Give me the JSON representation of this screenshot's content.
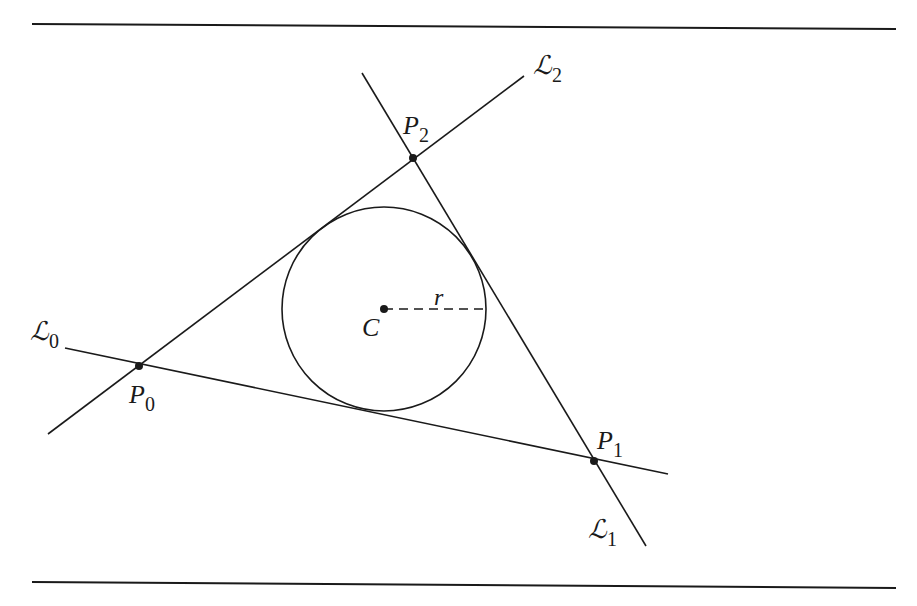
{
  "diagram": {
    "colors": {
      "stroke": "#1a1a1a",
      "background": "#ffffff"
    },
    "rules": {
      "top_y": 24,
      "bottom_y": 587,
      "x_start": 32,
      "x_end": 896
    },
    "lines": [
      {
        "name": "L0",
        "label": "ℒ",
        "subscript": "0",
        "from": [
          65,
          348
        ],
        "to": [
          668,
          474
        ]
      },
      {
        "name": "L1",
        "label": "ℒ",
        "subscript": "1",
        "from": [
          362,
          73
        ],
        "to": [
          646,
          546
        ]
      },
      {
        "name": "L2",
        "label": "ℒ",
        "subscript": "2",
        "from": [
          48,
          434
        ],
        "to": [
          524,
          76
        ]
      }
    ],
    "points": [
      {
        "name": "P0",
        "label": "P",
        "subscript": "0",
        "x": 139,
        "y": 366
      },
      {
        "name": "P1",
        "label": "P",
        "subscript": "1",
        "x": 594,
        "y": 461
      },
      {
        "name": "P2",
        "label": "P",
        "subscript": "2",
        "x": 413,
        "y": 158
      }
    ],
    "circle": {
      "center_label": "C",
      "radius_label": "r",
      "cx": 384,
      "cy": 309,
      "r": 102
    },
    "labels": {
      "L0": "ℒ",
      "L0_sub": "0",
      "L1": "ℒ",
      "L1_sub": "1",
      "L2": "ℒ",
      "L2_sub": "2",
      "P0": "P",
      "P0_sub": "0",
      "P1": "P",
      "P1_sub": "1",
      "P2": "P",
      "P2_sub": "2",
      "C": "C",
      "r": "r"
    }
  }
}
